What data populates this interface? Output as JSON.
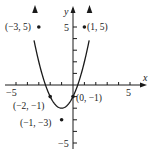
{
  "chart_data": {
    "type": "line",
    "title": "",
    "function": "y = x^2 + 2x - 1",
    "xlabel": "x",
    "ylabel": "y",
    "xlim": [
      -6,
      6
    ],
    "ylim": [
      -5.5,
      7
    ],
    "x_ticks": [
      -5,
      -4,
      -3,
      -2,
      -1,
      1,
      2,
      3,
      4,
      5
    ],
    "y_ticks": [
      -5,
      -4,
      -3,
      -2,
      -1,
      1,
      2,
      3,
      4,
      5
    ],
    "x_tick_labels": [
      {
        "value": -5,
        "label": "−5"
      },
      {
        "value": 5,
        "label": "5"
      }
    ],
    "y_tick_labels": [
      {
        "value": 5,
        "label": "5"
      },
      {
        "value": -5,
        "label": "−5"
      }
    ],
    "grid": false,
    "series": [
      {
        "name": "parabola",
        "x": [
          -3.4,
          -3,
          -2,
          -1,
          0,
          1,
          1.4
        ],
        "y": [
          6.56,
          2,
          -1,
          -2,
          -1,
          2,
          4.76
        ]
      }
    ],
    "points": [
      {
        "x": -3,
        "y": 5,
        "label": "(−3, 5)"
      },
      {
        "x": 1,
        "y": 5,
        "label": "(1, 5)"
      },
      {
        "x": -2,
        "y": -1,
        "label": "(−2, −1)"
      },
      {
        "x": 0,
        "y": -1,
        "label": "(0, −1)"
      },
      {
        "x": -1,
        "y": -3,
        "label": "(−1, −3)"
      }
    ]
  },
  "labels": {
    "x_axis": "x",
    "y_axis": "y",
    "x_neg5": "−5",
    "x_pos5": "5",
    "y_pos5": "5",
    "y_neg5": "−5",
    "pt_m3_5": "(−3, 5)",
    "pt_1_5": "(1, 5)",
    "pt_m2_m1": "(−2, −1)",
    "pt_0_m1": "(0, −1)",
    "pt_m1_m3": "(−1, −3)"
  }
}
